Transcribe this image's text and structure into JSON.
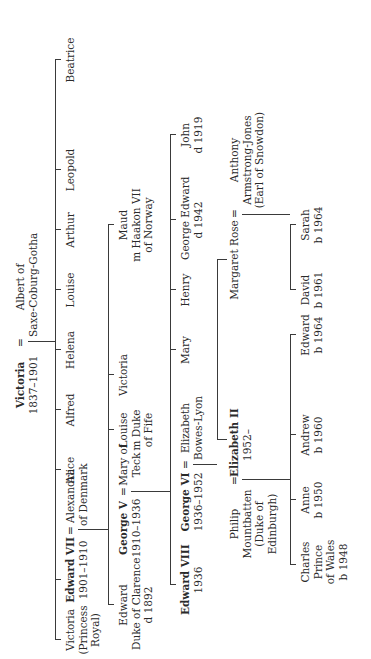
{
  "diagram": {
    "root": {
      "name": "Victoria",
      "reign": "1837–1901",
      "spouse_sign": "=",
      "spouse_line1": "Albert of",
      "spouse_line2": "Saxe-Coburg-Gotha"
    },
    "gen1": [
      {
        "line1": "Victoria",
        "line2": "(Princess",
        "line3": "Royal)"
      },
      {
        "name": "Edward VII",
        "reign": "1901–1910",
        "spouse_sign": "=",
        "spouse_line1": "Alexandra",
        "spouse_line2": "of Denmark"
      },
      {
        "name": "Alice"
      },
      {
        "name": "Alfred"
      },
      {
        "name": "Helena"
      },
      {
        "name": "Louise"
      },
      {
        "name": "Arthur"
      },
      {
        "name": "Leopold"
      },
      {
        "name": "Beatrice"
      }
    ],
    "gen2": [
      {
        "line1": "Edward",
        "line2": "Duke of Clarence",
        "line3": "d 1892"
      },
      {
        "name": "George V",
        "reign": "1910–1936",
        "spouse_sign": "=",
        "spouse_line1": "Mary of",
        "spouse_line2": "Teck"
      },
      {
        "line1": "Louise",
        "line2": "m Duke",
        "line3": "of Fife"
      },
      {
        "name": "Victoria"
      },
      {
        "line1": "Maud",
        "line2": "m Haakon VII",
        "line3": "of Norway"
      }
    ],
    "gen3": [
      {
        "name": "Edward VIII",
        "reign": "1936"
      },
      {
        "name": "George VI",
        "reign": "1936–1952",
        "spouse_sign": "=",
        "spouse_line1": "Elizabeth",
        "spouse_line2": "Bowes-Lyon"
      },
      {
        "name": "Mary"
      },
      {
        "name": "Henry"
      },
      {
        "line1": "George Edward",
        "line2": "d 1942"
      },
      {
        "line1": "John",
        "line2": "d 1919"
      }
    ],
    "gen4": [
      {
        "spouse_line1": "Philip",
        "spouse_line2": "Mountbatten",
        "spouse_line3": "(Duke of",
        "spouse_line4": "Edinburgh)",
        "spouse_sign": "=",
        "name": "Elizabeth II",
        "reign": "1952–"
      },
      {
        "name": "Margaret Rose",
        "spouse_sign": "=",
        "spouse_line1": "Anthony",
        "spouse_line2": "Armstrong-Jones",
        "spouse_line3": "(Earl of Snowdon)"
      }
    ],
    "gen5_elizabeth": [
      {
        "line1": "Charles",
        "line2": "Prince",
        "line3": "of Wales",
        "line4": "b 1948"
      },
      {
        "line1": "Anne",
        "line2": "b 1950"
      },
      {
        "line1": "Andrew",
        "line2": "b 1960"
      },
      {
        "line1": "Edward",
        "line2": "b 1964"
      }
    ],
    "gen5_margaret": [
      {
        "line1": "David",
        "line2": "b 1961"
      },
      {
        "line1": "Sarah",
        "line2": "b 1964"
      }
    ],
    "colors": {
      "line": "#3a3a3a",
      "text": "#2a2a2a",
      "background": "#ffffff"
    }
  }
}
